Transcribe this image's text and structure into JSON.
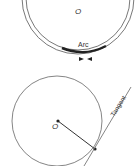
{
  "diagram_top": {
    "center_label": "O",
    "arc_label": "Arc"
  },
  "diagram_bottom": {
    "center_label": "O",
    "tangent_label": "Tangent"
  },
  "colors": {
    "stroke": "#555555",
    "arc": "#222222",
    "text": "#333333"
  }
}
